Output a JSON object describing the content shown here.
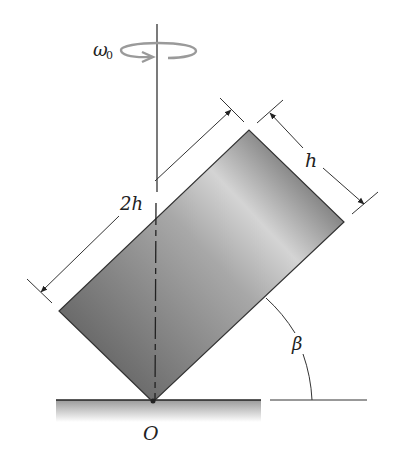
{
  "diagram": {
    "type": "physics-figure",
    "labels": {
      "omega": "ω",
      "omega_sub": "0",
      "long_side": "2h",
      "short_side": "h",
      "angle": "β",
      "pivot": "O"
    },
    "colors": {
      "block_dark": "#6e6e6e",
      "block_light": "#d2d2d2",
      "line": "#333333",
      "rotation_arrow": "#9a9a9a",
      "ground": "#bdbdbd"
    }
  }
}
